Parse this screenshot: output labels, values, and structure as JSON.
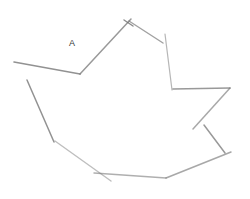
{
  "diagram": {
    "type": "hand-drawn-polygon-sketch",
    "stroke_color": "#6e6e6e",
    "background": "#ffffff",
    "labels": [
      {
        "id": "label-a",
        "text": "A",
        "x": 69,
        "y": 41
      }
    ],
    "segments": [
      {
        "x1": 14,
        "y1": 62,
        "x2": 80,
        "y2": 74,
        "opacity": 0.75,
        "width": 1.6
      },
      {
        "x1": 80,
        "y1": 74,
        "x2": 131,
        "y2": 19,
        "opacity": 0.7,
        "width": 1.5
      },
      {
        "x1": 124,
        "y1": 20,
        "x2": 133,
        "y2": 26,
        "opacity": 0.8,
        "width": 1.4
      },
      {
        "x1": 129,
        "y1": 21,
        "x2": 163,
        "y2": 43,
        "opacity": 0.65,
        "width": 1.4
      },
      {
        "x1": 165,
        "y1": 34,
        "x2": 172,
        "y2": 90,
        "opacity": 0.5,
        "width": 1.2
      },
      {
        "x1": 173,
        "y1": 89,
        "x2": 230,
        "y2": 88,
        "opacity": 0.7,
        "width": 1.6
      },
      {
        "x1": 230,
        "y1": 88,
        "x2": 193,
        "y2": 129,
        "opacity": 0.6,
        "width": 1.5
      },
      {
        "x1": 204,
        "y1": 125,
        "x2": 225,
        "y2": 153,
        "opacity": 0.7,
        "width": 1.5
      },
      {
        "x1": 231,
        "y1": 152,
        "x2": 166,
        "y2": 178,
        "opacity": 0.6,
        "width": 1.5
      },
      {
        "x1": 166,
        "y1": 178,
        "x2": 94,
        "y2": 173,
        "opacity": 0.55,
        "width": 1.4
      },
      {
        "x1": 27,
        "y1": 80,
        "x2": 54,
        "y2": 142,
        "opacity": 0.75,
        "width": 1.5
      },
      {
        "x1": 55,
        "y1": 141,
        "x2": 111,
        "y2": 181,
        "opacity": 0.45,
        "width": 1.4
      }
    ]
  }
}
